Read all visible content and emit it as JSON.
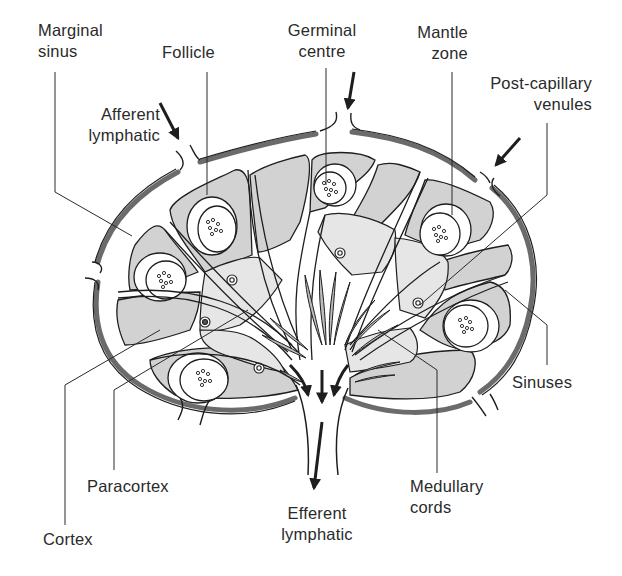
{
  "diagram": {
    "colors": {
      "capsule": "#6b6b6b",
      "cortex_fill": "#d2d2d2",
      "paracortex_fill": "#e6e6e6",
      "sinus_fill": "#ffffff",
      "outline": "#1e1e1e",
      "text": "#2a2a2a"
    },
    "labels": {
      "marginal_sinus": {
        "line1": "Marginal",
        "line2": "sinus"
      },
      "follicle": {
        "line1": "Follicle"
      },
      "germinal_centre": {
        "line1": "Germinal",
        "line2": "centre"
      },
      "mantle_zone": {
        "line1": "Mantle",
        "line2": "zone"
      },
      "post_capillary_venules": {
        "line1": "Post-capillary",
        "line2": "venules"
      },
      "afferent_lymphatic": {
        "line1": "Afferent",
        "line2": "lymphatic"
      },
      "sinuses": {
        "line1": "Sinuses"
      },
      "paracortex": {
        "line1": "Paracortex"
      },
      "medullary_cords": {
        "line1": "Medullary",
        "line2": "cords"
      },
      "efferent_lymphatic": {
        "line1": "Efferent",
        "line2": "lymphatic"
      },
      "cortex": {
        "line1": "Cortex"
      }
    }
  }
}
